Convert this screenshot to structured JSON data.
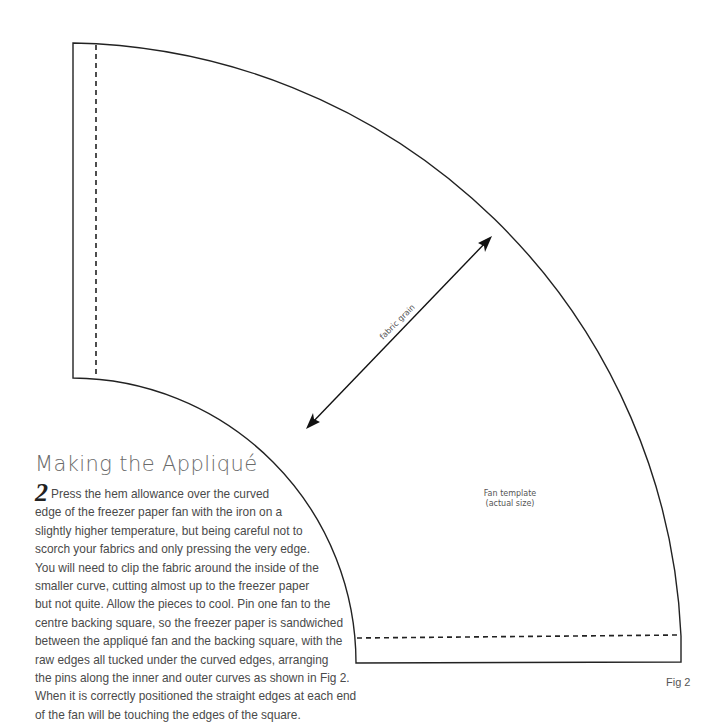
{
  "figure": {
    "template_label_line1": "Fan template",
    "template_label_line2": "(actual size)",
    "grain_label": "fabric grain",
    "figure_label": "Fig 2",
    "line_color": "#222222",
    "dash_color": "#222222"
  },
  "section": {
    "heading": "Making the Appliqué",
    "step_number": "2",
    "lines": [
      "Press the hem allowance over the curved",
      "edge of the freezer paper fan with the iron on a",
      "slightly higher temperature, but being careful not to",
      "scorch your fabrics and only pressing the very edge.",
      "You will need to clip the fabric around the inside of the",
      "smaller curve, cutting almost up to the freezer paper",
      "but not quite. Allow the pieces to cool. Pin one fan to the",
      "centre backing square, so the freezer paper is sandwiched",
      "between the appliqué fan and the backing square, with the",
      "raw edges all tucked under the curved edges, arranging",
      "the pins along the inner and outer curves as shown in Fig 2.",
      "When it is correctly positioned the straight edges at each end",
      "of the fan will be touching the edges of the square."
    ]
  }
}
